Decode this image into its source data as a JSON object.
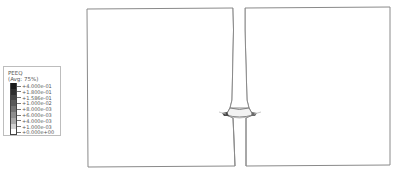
{
  "legend": {
    "title": "PEEQ",
    "subtitle": "(Avg: 75%)",
    "entries": [
      {
        "label": "+4.000e-01",
        "color": "#1a1a1a"
      },
      {
        "label": "+1.800e-01",
        "color": "#2e2e2e"
      },
      {
        "label": "+1.586e-01",
        "color": "#444444"
      },
      {
        "label": "+1.000e-02",
        "color": "#5a5a5a"
      },
      {
        "label": "+8.000e-03",
        "color": "#747474"
      },
      {
        "label": "+6.000e-03",
        "color": "#8e8e8e"
      },
      {
        "label": "+4.000e-03",
        "color": "#a8a8a8"
      },
      {
        "label": "+1.000e-03",
        "color": "#d0d0d0"
      },
      {
        "label": "+0.000e+00",
        "color": "#ffffff"
      }
    ]
  },
  "model": {
    "description": "Deformed finite element model: two plates with a necked connecting bar",
    "line_color": "#7a7a7a"
  }
}
